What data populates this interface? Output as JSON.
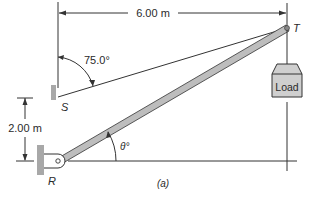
{
  "figure": {
    "caption": "(a)",
    "dimensions": {
      "horizontal_span": "6.00 m",
      "vertical_offset": "2.00 m"
    },
    "angles": {
      "cable_angle": "75.0°",
      "strut_angle": "θ°"
    },
    "points": {
      "top": "T",
      "cable_anchor": "S",
      "pivot": "R"
    },
    "load_label": "Load"
  },
  "colors": {
    "line": "#333333",
    "wall": "#a8a8a8",
    "strut_fill": "#bdbdbd",
    "load_fill": "#cfcfcf"
  }
}
